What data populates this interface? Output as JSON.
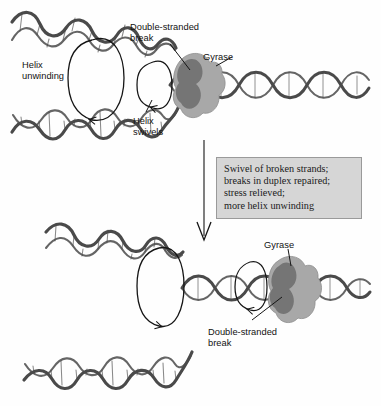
{
  "figure": {
    "background_color": "#fefefe",
    "dna_color": "#4a4a4a",
    "dna_color_dark": "#3a3a3a",
    "gyrase_color": "#a8a8a8",
    "gyrase_core_color": "#6f6f6f",
    "line_color": "#151515",
    "box_fill": "#d6d6d6",
    "box_border": "#9a9a9a"
  },
  "panel_top": {
    "labels": [
      {
        "id": "helix-unwinding",
        "text": "Helix\nunwinding",
        "x": 22,
        "y": 60
      },
      {
        "id": "double-stranded-break",
        "text": "Double-stranded\nbreak",
        "x": 130,
        "y": 22
      },
      {
        "id": "gyrase",
        "text": "Gyrase",
        "x": 203,
        "y": 52
      },
      {
        "id": "helix-swivels",
        "text": "Helix\nswivels",
        "x": 133,
        "y": 116
      }
    ]
  },
  "transition": {
    "arrow_label": "process-arrow",
    "summary_text": "Swivel of broken strands;\nbreaks in duplex repaired;\nstress relieved;\nmore helix unwinding"
  },
  "panel_bottom": {
    "labels": [
      {
        "id": "gyrase",
        "text": "Gyrase",
        "x": 264,
        "y": 240
      },
      {
        "id": "double-stranded-break",
        "text": "Double-stranded\nbreak",
        "x": 208,
        "y": 327
      }
    ]
  }
}
